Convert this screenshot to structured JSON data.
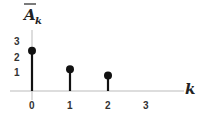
{
  "chart_data": {
    "type": "stem",
    "title": "",
    "xlabel": "k",
    "ylabel": "A̅_k",
    "ylabel_main": "A",
    "ylabel_sub": "k",
    "x": [
      0,
      1,
      2
    ],
    "values": [
      2.6,
      1.4,
      1.0
    ],
    "x_ticks": [
      "0",
      "1",
      "2",
      "3"
    ],
    "y_ticks": [
      "1",
      "2",
      "3"
    ],
    "xlim": [
      -0.4,
      4
    ],
    "ylim": [
      0,
      3.5
    ],
    "grid": false,
    "legend": null
  },
  "colors": {
    "stem": "#111111",
    "axis": "#bbbbbb",
    "text": "#333333"
  }
}
